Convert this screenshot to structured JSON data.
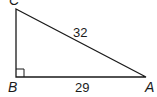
{
  "figure": {
    "type": "right-triangle",
    "colors": {
      "stroke": "#1a1a1a",
      "background": "#ffffff"
    },
    "vertices": {
      "C": {
        "label": "C",
        "x": 16,
        "y": 9
      },
      "B": {
        "label": "B",
        "x": 16,
        "y": 77
      },
      "A": {
        "label": "A",
        "x": 146,
        "y": 77
      }
    },
    "right_angle_at": "B",
    "sides": {
      "CA": {
        "label": "32",
        "role": "hypotenuse"
      },
      "BA": {
        "label": "29",
        "role": "leg"
      }
    }
  }
}
